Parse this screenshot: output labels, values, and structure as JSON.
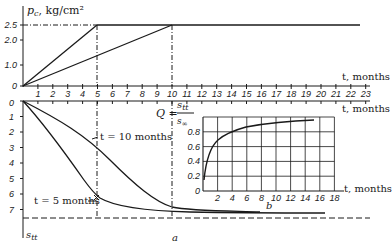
{
  "figure": {
    "panel_a_label": "a",
    "panel_b_label": "b"
  },
  "top_chart": {
    "ylabel_symbol": "p",
    "ylabel_sub": "c",
    "ylabel_unit": ", kg/cm²",
    "xlabel": "t, months",
    "yticks": [
      "0",
      "1.0",
      "2.0",
      "2.5"
    ],
    "xticks": [
      "1",
      "2",
      "3",
      "4",
      "5",
      "6",
      "7",
      "8",
      "9",
      "10",
      "11",
      "12",
      "13",
      "14",
      "15",
      "16",
      "17",
      "18",
      "19",
      "20",
      "21",
      "22",
      "23"
    ]
  },
  "bottom_chart": {
    "ylabel_symbol": "s",
    "ylabel_sub": "tt",
    "xlabel": "t, months",
    "yticks": [
      "0",
      "1",
      "2",
      "3",
      "4",
      "5",
      "6",
      "7"
    ],
    "curve_labels": [
      "t = 10 months",
      "t = 5 months"
    ]
  },
  "inset": {
    "formula_lhs": "Q =",
    "formula_num": "s",
    "formula_num_sub": "tt",
    "formula_den": "s",
    "formula_den_sub": "∞",
    "xlabel": "t, months",
    "yticks": [
      "0",
      "0.2",
      "0.4",
      "0.6",
      "0.8"
    ],
    "xticks": [
      "2",
      "4",
      "6",
      "8",
      "10",
      "12",
      "14",
      "16",
      "18"
    ]
  },
  "chart_data": [
    {
      "type": "line",
      "title": "Load vs time",
      "xlabel": "t, months",
      "ylabel": "p_c, kg/cm²",
      "xlim": [
        0,
        23
      ],
      "ylim": [
        0,
        2.5
      ],
      "series": [
        {
          "name": "loading to t = 5 months",
          "x": [
            0,
            5,
            23
          ],
          "y": [
            0,
            2.5,
            2.5
          ]
        },
        {
          "name": "loading to t = 10 months",
          "x": [
            0,
            10,
            23
          ],
          "y": [
            0,
            2.5,
            2.5
          ]
        }
      ],
      "annotations": [
        "dashed line at p = 2.5",
        "dashed verticals at t = 5 and t = 10"
      ]
    },
    {
      "type": "line",
      "title": "Settlement vs time",
      "xlabel": "t, months",
      "ylabel": "s_tt",
      "xlim": [
        0,
        23
      ],
      "ylim": [
        7.6,
        0
      ],
      "series": [
        {
          "name": "t = 5 months",
          "x": [
            0,
            2,
            4,
            5,
            7,
            10,
            15,
            20
          ],
          "y": [
            0,
            2.0,
            4.9,
            5.9,
            6.8,
            7.2,
            7.35,
            7.4
          ]
        },
        {
          "name": "t = 10 months",
          "x": [
            0,
            2,
            5,
            8,
            10,
            12,
            15,
            20
          ],
          "y": [
            0,
            1.2,
            3.0,
            5.0,
            6.6,
            7.0,
            7.3,
            7.4
          ]
        }
      ],
      "annotations": [
        "dashed asymptote at s ≈ 7.6"
      ]
    },
    {
      "type": "line",
      "title": "Q = s_tt / s_∞",
      "xlabel": "t, months",
      "ylabel": "Q",
      "xlim": [
        0,
        18
      ],
      "ylim": [
        0,
        1.0
      ],
      "grid": true,
      "series": [
        {
          "name": "Q",
          "x": [
            0,
            0.5,
            1,
            2,
            3,
            4,
            6,
            8,
            10,
            12,
            15
          ],
          "y": [
            0.15,
            0.4,
            0.55,
            0.66,
            0.73,
            0.77,
            0.82,
            0.86,
            0.89,
            0.91,
            0.92
          ]
        }
      ]
    }
  ]
}
